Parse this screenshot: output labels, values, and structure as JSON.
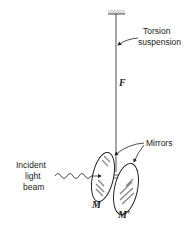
{
  "figure": {
    "type": "physics-apparatus-diagram",
    "colors": {
      "ink": "#222222",
      "hatch": "#888888",
      "background": "#ffffff"
    }
  },
  "labels": {
    "torsion_line1": "Torsion",
    "torsion_line2": "suspension",
    "fiber": "F",
    "mirrors": "Mirrors",
    "incident_line1": "Incident",
    "incident_line2": "light",
    "incident_line3": "beam",
    "mirror_m": "M",
    "mirror_m_prime": "M'"
  },
  "components": [
    {
      "id": "ceiling-support",
      "icon": "hatched-ceiling"
    },
    {
      "id": "torsion-fiber",
      "label_ref": "fiber"
    },
    {
      "id": "mirror-m",
      "label_ref": "mirror_m"
    },
    {
      "id": "mirror-m-prime",
      "label_ref": "mirror_m_prime"
    },
    {
      "id": "light-beam",
      "icon": "wavy-arrow"
    }
  ]
}
